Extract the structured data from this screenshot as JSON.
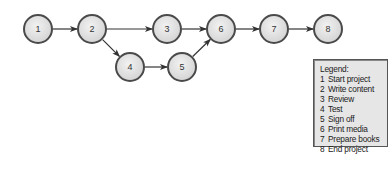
{
  "diagram": {
    "nodes": [
      {
        "id": "1",
        "label": "1",
        "x": 38,
        "y": 29
      },
      {
        "id": "2",
        "label": "2",
        "x": 92,
        "y": 29
      },
      {
        "id": "3",
        "label": "3",
        "x": 167,
        "y": 29
      },
      {
        "id": "4",
        "label": "4",
        "x": 130,
        "y": 67
      },
      {
        "id": "5",
        "label": "5",
        "x": 182,
        "y": 67
      },
      {
        "id": "6",
        "label": "6",
        "x": 221,
        "y": 29
      },
      {
        "id": "7",
        "label": "7",
        "x": 274,
        "y": 29
      },
      {
        "id": "8",
        "label": "8",
        "x": 328,
        "y": 29
      }
    ],
    "edges": [
      {
        "from": "1",
        "to": "2"
      },
      {
        "from": "2",
        "to": "3"
      },
      {
        "from": "2",
        "to": "4"
      },
      {
        "from": "3",
        "to": "6"
      },
      {
        "from": "4",
        "to": "5"
      },
      {
        "from": "5",
        "to": "6"
      },
      {
        "from": "6",
        "to": "7"
      },
      {
        "from": "7",
        "to": "8"
      }
    ],
    "node_radius": 14,
    "colors": {
      "node_fill": "#e3e3e3",
      "node_stroke": "#4a4a4a",
      "edge": "#333333"
    }
  },
  "legend": {
    "title": "Legend:",
    "items": [
      {
        "num": "1",
        "label": "Start project"
      },
      {
        "num": "2",
        "label": "Write content"
      },
      {
        "num": "3",
        "label": "Review"
      },
      {
        "num": "4",
        "label": "Test"
      },
      {
        "num": "5",
        "label": "Sign off"
      },
      {
        "num": "6",
        "label": "Print media"
      },
      {
        "num": "7",
        "label": "Prepare books"
      },
      {
        "num": "8",
        "label": "End project"
      }
    ]
  }
}
